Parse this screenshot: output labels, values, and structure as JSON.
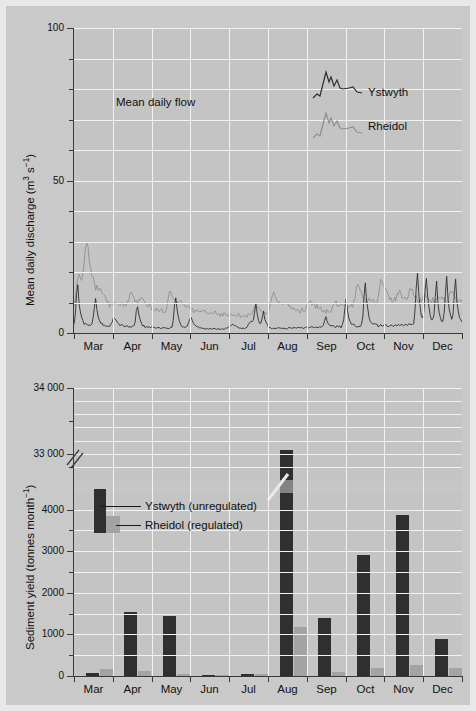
{
  "figure": {
    "background_color": "#c9c9c9",
    "plot_background_color": "#c4c4c4",
    "grid_color": "#f2f2f2",
    "series_colors": {
      "ystwyth": "#2f2f2f",
      "rheidol": "#8f8f8f"
    },
    "bar_colors": {
      "ystwyth": "#2f2f2f",
      "rheidol": "#a3a3a3"
    }
  },
  "panels": {
    "flow": {
      "annotation": "Mean daily flow",
      "ylabel_prefix": "Mean daily discharge (m",
      "ylabel_sup1": "3",
      "ylabel_mid": " s",
      "ylabel_sup2": "−1",
      "ylabel_suffix": ")",
      "ytick_labels": [
        "100",
        "50",
        "0"
      ],
      "ytick_values": [
        100,
        50,
        0
      ],
      "ylim": [
        0,
        100
      ],
      "minor_tick_step": 10,
      "legend": [
        {
          "name": "Ystwyth",
          "color": "#2f2f2f"
        },
        {
          "name": "Rheidol",
          "color": "#8f8f8f"
        }
      ]
    },
    "sediment": {
      "ylabel_prefix": "Sediment yield (tonnes month",
      "ylabel_sup": "−1",
      "ylabel_suffix": ")",
      "ytick_labels": [
        "34 000",
        "33 000",
        "4000",
        "3000",
        "2000",
        "1000",
        "0"
      ],
      "axis_break": true,
      "axis_break_note": "broken y-axis between 4000 and 33000",
      "legend": [
        {
          "label": "Ystwyth (unregulated)",
          "color": "#2f2f2f"
        },
        {
          "label": "Rheidol (regulated)",
          "color": "#a3a3a3"
        }
      ]
    }
  },
  "months": [
    "Mar",
    "Apr",
    "May",
    "Jun",
    "Jul",
    "Aug",
    "Sep",
    "Oct",
    "Nov",
    "Dec"
  ],
  "chart_data": [
    {
      "type": "line",
      "title": "Mean daily flow",
      "xlabel": "",
      "ylabel": "Mean daily discharge (m3 s-1)",
      "ylim": [
        0,
        100
      ],
      "ytick_values": [
        0,
        50,
        100
      ],
      "grid": true,
      "legend_position": "upper-right",
      "x": [
        "Mar",
        "Apr",
        "May",
        "Jun",
        "Jul",
        "Aug",
        "Sep",
        "Oct",
        "Nov",
        "Dec"
      ],
      "series": [
        {
          "name": "Ystwyth",
          "color": "#2f2f2f",
          "description": "Unregulated river: flashy hydrograph with sharp narrow peaks; largest peak ~85 in early August",
          "peaks": [
            {
              "month": "Mar",
              "value": 22
            },
            {
              "month": "Apr",
              "value": 27
            },
            {
              "month": "May",
              "value": 27
            },
            {
              "month": "Jul",
              "value": 9
            },
            {
              "month": "Aug",
              "value": 85
            },
            {
              "month": "Aug",
              "value": 22
            },
            {
              "month": "Sep",
              "value": 23
            },
            {
              "month": "Oct",
              "value": 39
            },
            {
              "month": "Nov",
              "value": 38
            },
            {
              "month": "Nov",
              "value": 31
            },
            {
              "month": "Dec",
              "value": 27
            }
          ],
          "baseflow_range": [
            0,
            3
          ]
        },
        {
          "name": "Rheidol",
          "color": "#8f8f8f",
          "description": "Regulated river: damped hydrograph, higher and steadier baseflow, subdued peaks",
          "peaks": [
            {
              "month": "Mar",
              "value": 30
            },
            {
              "month": "Apr",
              "value": 13
            },
            {
              "month": "May",
              "value": 14
            },
            {
              "month": "Aug",
              "value": 14
            },
            {
              "month": "Oct",
              "value": 16
            },
            {
              "month": "Nov",
              "value": 18
            },
            {
              "month": "Dec",
              "value": 15
            }
          ],
          "baseflow_range": [
            4,
            10
          ]
        }
      ]
    },
    {
      "type": "bar",
      "title": "",
      "xlabel": "",
      "ylabel": "Sediment yield (tonnes month-1)",
      "ylim": [
        0,
        34000
      ],
      "ytick_values": [
        0,
        1000,
        2000,
        3000,
        4000,
        33000,
        34000
      ],
      "axis_break": [
        4400,
        32600
      ],
      "grid": true,
      "legend_position": "inside-left",
      "categories": [
        "Mar",
        "Apr",
        "May",
        "Jun",
        "Jul",
        "Aug",
        "Sep",
        "Oct",
        "Nov",
        "Dec"
      ],
      "series": [
        {
          "name": "Ystwyth (unregulated)",
          "color": "#2f2f2f",
          "values": [
            70,
            1530,
            1450,
            25,
            55,
            33050,
            1400,
            2900,
            3870,
            880
          ]
        },
        {
          "name": "Rheidol (regulated)",
          "color": "#a3a3a3",
          "values": [
            160,
            120,
            50,
            15,
            40,
            1170,
            90,
            200,
            270,
            200
          ]
        }
      ]
    }
  ]
}
